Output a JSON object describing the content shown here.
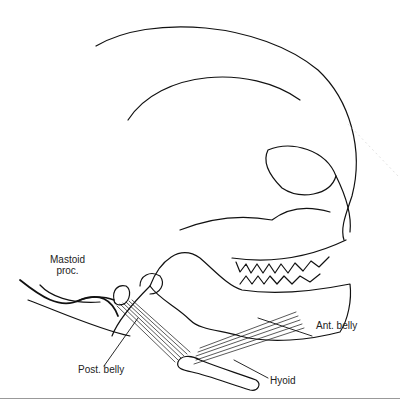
{
  "figure": {
    "labels": {
      "mastoid_line1": "Mastoid",
      "mastoid_line2": "proc.",
      "post_belly": "Post. belly",
      "ant_belly": "Ant. belly",
      "hyoid": "Hyoid"
    }
  }
}
